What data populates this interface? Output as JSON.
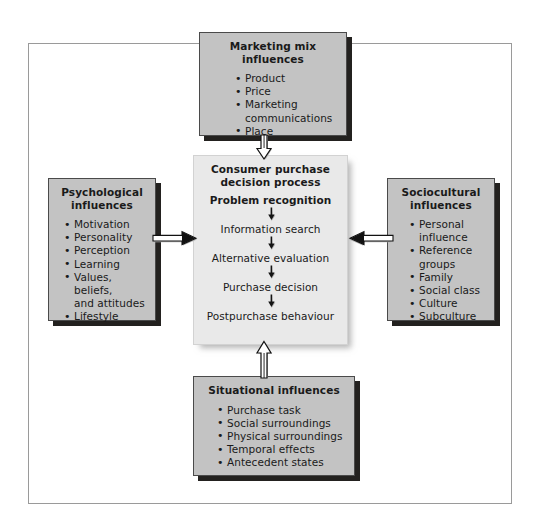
{
  "diagram": {
    "colors": {
      "side_box_fill": "#c3c3c3",
      "center_box_fill": "#e9e9e9",
      "box_border": "#4a4a4a",
      "shadow": "#23211f",
      "frame_border": "#9a9a9a",
      "text": "#1a1a1a"
    }
  },
  "boxes": {
    "top": {
      "title": "Marketing mix influences",
      "items": [
        "Product",
        "Price",
        "Marketing communications",
        "Place"
      ],
      "items_wrapped": [
        [
          "Product"
        ],
        [
          "Price"
        ],
        [
          "Marketing",
          "communications"
        ],
        [
          "Place"
        ]
      ]
    },
    "left": {
      "title_line1": "Psychological",
      "title_line2": "influences",
      "items": [
        "Motivation",
        "Personality",
        "Perception",
        "Learning",
        "Values, beliefs, and attitudes",
        "Lifestyle"
      ],
      "items_wrapped": [
        [
          "Motivation"
        ],
        [
          "Personality"
        ],
        [
          "Perception"
        ],
        [
          "Learning"
        ],
        [
          "Values, beliefs,",
          "and attitudes"
        ],
        [
          "Lifestyle"
        ]
      ]
    },
    "right": {
      "title_line1": "Sociocultural",
      "title_line2": "influences",
      "items": [
        "Personal influence",
        "Reference groups",
        "Family",
        "Social class",
        "Culture",
        "Subculture"
      ],
      "items_wrapped": [
        [
          "Personal",
          "influence"
        ],
        [
          "Reference",
          "groups"
        ],
        [
          "Family"
        ],
        [
          "Social class"
        ],
        [
          "Culture"
        ],
        [
          "Subculture"
        ]
      ]
    },
    "bottom": {
      "title": "Situational influences",
      "items": [
        "Purchase task",
        "Social surroundings",
        "Physical surroundings",
        "Temporal effects",
        "Antecedent states"
      ],
      "items_wrapped": [
        [
          "Purchase task"
        ],
        [
          "Social surroundings"
        ],
        [
          "Physical surroundings"
        ],
        [
          "Temporal effects"
        ],
        [
          "Antecedent states"
        ]
      ]
    },
    "center": {
      "title_line1": "Consumer purchase",
      "title_line2": "decision process",
      "steps": [
        "Problem recognition",
        "Information search",
        "Alternative evaluation",
        "Purchase decision",
        "Postpurchase behaviour"
      ]
    }
  },
  "connectors": [
    {
      "name": "marketing-mix-to-center",
      "from": "top",
      "to": "center",
      "direction": "down"
    },
    {
      "name": "situational-to-center",
      "from": "bottom",
      "to": "center",
      "direction": "up"
    },
    {
      "name": "psychological-to-center",
      "from": "left",
      "to": "center",
      "direction": "right"
    },
    {
      "name": "sociocultural-to-center",
      "from": "right",
      "to": "center",
      "direction": "left"
    }
  ]
}
